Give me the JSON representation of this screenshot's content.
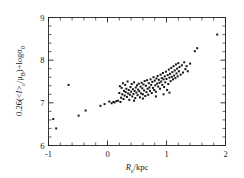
{
  "figure": {
    "background_color": "#ffffff",
    "ink_color": "#1a1a1a"
  },
  "chart_data": {
    "type": "scatter",
    "title": "",
    "subtitle": "",
    "xlabel": "R_e/kpc",
    "xlabel_parts": {
      "symbol": "R",
      "subscript": "e",
      "suffix": "/kpc"
    },
    "ylabel": "0.26(<I>_e/μ_B)+logσ_0",
    "ylabel_parts": {
      "coefficient": "0.26",
      "open": "(<",
      "intensity_symbol": "I",
      "close_bracket": ">",
      "intensity_subscript": "e",
      "slash": "/",
      "mu_symbol": "μ",
      "mu_subscript": "B",
      "close": ")",
      "plus": "+log",
      "sigma_symbol": "σ",
      "sigma_subscript": "0"
    },
    "xlim": [
      -1,
      2
    ],
    "ylim": [
      6,
      9
    ],
    "xticks": [
      -1,
      0,
      1,
      2
    ],
    "xticklabels": [
      "-1",
      "0",
      "1",
      "2"
    ],
    "yticks": [
      6,
      7,
      8,
      9
    ],
    "yticklabels": [
      "6",
      "7",
      "8",
      "9"
    ],
    "x_minor_interval": 0.2,
    "y_minor_interval": 0.2,
    "grid": false,
    "legend": null,
    "legend_position": "none",
    "marker": "square",
    "marker_size_px": 2.0,
    "marker_color": "#151515",
    "n_points": 132,
    "points": [
      [
        -0.92,
        6.62
      ],
      [
        -0.87,
        6.4
      ],
      [
        -0.66,
        7.42
      ],
      [
        -0.49,
        6.7
      ],
      [
        -0.37,
        6.82
      ],
      [
        -0.12,
        6.93
      ],
      [
        -0.05,
        6.97
      ],
      [
        0.03,
        7.03
      ],
      [
        0.07,
        6.99
      ],
      [
        0.1,
        7.02
      ],
      [
        0.12,
        7.01
      ],
      [
        0.15,
        7.04
      ],
      [
        0.18,
        7.05
      ],
      [
        0.2,
        7.23
      ],
      [
        0.21,
        7.39
      ],
      [
        0.23,
        7.12
      ],
      [
        0.24,
        7.35
      ],
      [
        0.25,
        7.2
      ],
      [
        0.26,
        7.46
      ],
      [
        0.27,
        7.09
      ],
      [
        0.28,
        7.28
      ],
      [
        0.29,
        7.17
      ],
      [
        0.3,
        7.42
      ],
      [
        0.31,
        7.25
      ],
      [
        0.32,
        7.33
      ],
      [
        0.33,
        7.14
      ],
      [
        0.34,
        7.5
      ],
      [
        0.35,
        7.22
      ],
      [
        0.36,
        7.3
      ],
      [
        0.37,
        7.07
      ],
      [
        0.38,
        7.19
      ],
      [
        0.39,
        7.37
      ],
      [
        0.4,
        7.26
      ],
      [
        0.41,
        7.44
      ],
      [
        0.42,
        7.15
      ],
      [
        0.43,
        7.32
      ],
      [
        0.44,
        7.21
      ],
      [
        0.45,
        7.48
      ],
      [
        0.46,
        7.28
      ],
      [
        0.47,
        7.11
      ],
      [
        0.48,
        7.36
      ],
      [
        0.49,
        7.24
      ],
      [
        0.5,
        7.41
      ],
      [
        0.51,
        7.18
      ],
      [
        0.52,
        7.31
      ],
      [
        0.53,
        7.45
      ],
      [
        0.54,
        7.27
      ],
      [
        0.55,
        7.13
      ],
      [
        0.56,
        7.38
      ],
      [
        0.57,
        7.22
      ],
      [
        0.58,
        7.47
      ],
      [
        0.59,
        7.34
      ],
      [
        0.6,
        7.2
      ],
      [
        0.61,
        7.43
      ],
      [
        0.62,
        7.29
      ],
      [
        0.63,
        7.51
      ],
      [
        0.64,
        7.16
      ],
      [
        0.65,
        7.4
      ],
      [
        0.66,
        7.25
      ],
      [
        0.67,
        7.53
      ],
      [
        0.68,
        7.33
      ],
      [
        0.69,
        7.19
      ],
      [
        0.7,
        7.46
      ],
      [
        0.71,
        7.36
      ],
      [
        0.72,
        7.28
      ],
      [
        0.73,
        7.55
      ],
      [
        0.74,
        7.42
      ],
      [
        0.75,
        7.23
      ],
      [
        0.76,
        7.49
      ],
      [
        0.77,
        7.35
      ],
      [
        0.78,
        7.6
      ],
      [
        0.79,
        7.3
      ],
      [
        0.8,
        7.52
      ],
      [
        0.81,
        7.41
      ],
      [
        0.82,
        7.26
      ],
      [
        0.83,
        7.57
      ],
      [
        0.84,
        7.45
      ],
      [
        0.85,
        7.63
      ],
      [
        0.86,
        7.38
      ],
      [
        0.87,
        7.54
      ],
      [
        0.88,
        7.47
      ],
      [
        0.89,
        7.33
      ],
      [
        0.9,
        7.66
      ],
      [
        0.91,
        7.5
      ],
      [
        0.92,
        7.58
      ],
      [
        0.93,
        7.42
      ],
      [
        0.94,
        7.7
      ],
      [
        0.95,
        7.55
      ],
      [
        0.96,
        7.37
      ],
      [
        0.97,
        7.62
      ],
      [
        0.98,
        7.48
      ],
      [
        0.99,
        7.73
      ],
      [
        1.0,
        7.56
      ],
      [
        1.01,
        7.3
      ],
      [
        1.02,
        7.65
      ],
      [
        1.03,
        7.44
      ],
      [
        1.04,
        7.78
      ],
      [
        1.05,
        7.59
      ],
      [
        1.06,
        7.68
      ],
      [
        1.07,
        7.51
      ],
      [
        1.08,
        7.82
      ],
      [
        1.09,
        7.61
      ],
      [
        1.1,
        7.72
      ],
      [
        1.11,
        7.55
      ],
      [
        1.12,
        7.86
      ],
      [
        1.13,
        7.64
      ],
      [
        1.14,
        7.76
      ],
      [
        1.15,
        7.58
      ],
      [
        1.16,
        7.9
      ],
      [
        1.17,
        7.69
      ],
      [
        1.18,
        7.8
      ],
      [
        1.19,
        7.62
      ],
      [
        1.2,
        7.93
      ],
      [
        1.21,
        7.74
      ],
      [
        1.22,
        7.84
      ],
      [
        1.24,
        7.66
      ],
      [
        1.26,
        7.88
      ],
      [
        1.28,
        7.71
      ],
      [
        1.3,
        7.95
      ],
      [
        1.32,
        7.79
      ],
      [
        1.34,
        7.86
      ],
      [
        1.36,
        7.74
      ],
      [
        1.4,
        7.92
      ],
      [
        1.48,
        8.21
      ],
      [
        1.52,
        8.28
      ],
      [
        1.86,
        8.6
      ],
      [
        0.22,
        7.02
      ],
      [
        0.45,
        7.05
      ],
      [
        0.6,
        7.1
      ],
      [
        0.82,
        7.15
      ],
      [
        0.95,
        7.2
      ],
      [
        1.05,
        7.24
      ]
    ]
  }
}
